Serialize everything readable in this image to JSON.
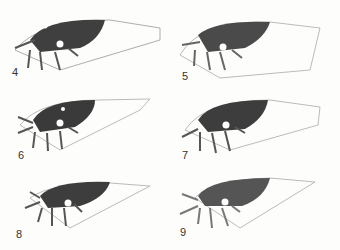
{
  "figure": {
    "type": "plate",
    "colors": {
      "background": "#fdfdfb",
      "dark": "#3a3a3a",
      "mid": "#5a5a5a",
      "vein": "#8a8a8a"
    },
    "panels": [
      {
        "label": "4",
        "x": 0,
        "y": 0
      },
      {
        "label": "5",
        "x": 170,
        "y": 0
      },
      {
        "label": "6",
        "x": 0,
        "y": 85
      },
      {
        "label": "7",
        "x": 170,
        "y": 85
      },
      {
        "label": "8",
        "x": 0,
        "y": 168
      },
      {
        "label": "9",
        "x": 170,
        "y": 168
      }
    ]
  }
}
